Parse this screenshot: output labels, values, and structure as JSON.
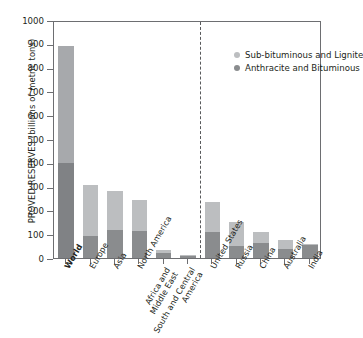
{
  "chart_data": {
    "type": "bar",
    "title": "",
    "subtitle": "",
    "xlabel": "",
    "ylabel": "PROVED RESERVES (billions of metric tons)",
    "ylim": [
      0,
      1000
    ],
    "yticks": [
      0,
      100,
      200,
      300,
      400,
      500,
      600,
      700,
      800,
      900,
      1000
    ],
    "grid": false,
    "stacked": true,
    "legend_position": "top-right",
    "categories": [
      "World",
      "Europe",
      "Asia",
      "North America",
      "Africa and Middle East",
      "South and Central America",
      "United States",
      "Russia",
      "China",
      "Australia",
      "India"
    ],
    "category_lines": [
      [
        "World"
      ],
      [
        "Europe"
      ],
      [
        "Asia"
      ],
      [
        "North America"
      ],
      [
        "Africa and",
        "Middle East"
      ],
      [
        "South and Central",
        "America"
      ],
      [
        "United States"
      ],
      [
        "Russia"
      ],
      [
        "China"
      ],
      [
        "Australia"
      ],
      [
        "India"
      ]
    ],
    "series": [
      {
        "name": "Anthracite and Bituminous",
        "color": "#8a8c8e",
        "values": [
          400,
          93,
          117,
          115,
          20,
          7,
          109,
          49,
          62,
          37,
          56
        ]
      },
      {
        "name": "Sub-bituminous and Lignite",
        "color": "#bcbec0",
        "values": [
          490,
          214,
          165,
          129,
          14,
          5,
          128,
          104,
          49,
          39,
          4
        ]
      }
    ],
    "totals": [
      890,
      307,
      282,
      244,
      34,
      12,
      237,
      153,
      111,
      76,
      60
    ],
    "annotations": [
      {
        "type": "vertical-dashed-divider",
        "after_category": "South and Central America",
        "note": "separates regions from individual countries"
      }
    ]
  },
  "legend": {
    "items": [
      {
        "label": "Sub-bituminous and Lignite",
        "color": "#bcbec0"
      },
      {
        "label": "Anthracite and Bituminous",
        "color": "#8a8c8e"
      }
    ]
  },
  "axis": {
    "y_title": "PROVED RESERVES (billions of metric tons)",
    "y_tick_labels": [
      "1000",
      "900",
      "800",
      "700",
      "600",
      "500",
      "400",
      "300",
      "200",
      "100",
      "0"
    ]
  },
  "colors": {
    "sub_bituminous": "#bcbec0",
    "anthracite": "#8a8c8e",
    "world_sub_bituminous": "#a7a9ac",
    "world_anthracite": "#808285",
    "axis": "#6d6e71",
    "text": "#231f20",
    "background": "#ffffff"
  }
}
